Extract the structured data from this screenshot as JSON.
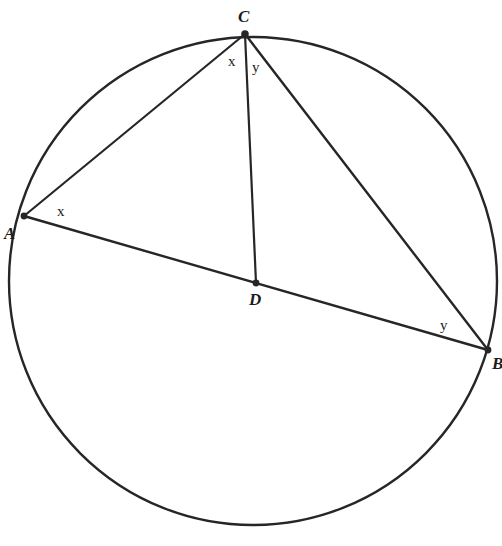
{
  "figure": {
    "canvas": {
      "width": 502,
      "height": 546
    },
    "colors": {
      "background": "#ffffff",
      "stroke": "#262626",
      "label": "#1c1c1c"
    },
    "circle": {
      "name": "circle-outline",
      "cx": 253,
      "cy": 281,
      "r": 244,
      "stroke_width": 2.4
    },
    "points": [
      {
        "id": "A",
        "label": "A",
        "x": 24,
        "y": 216,
        "label_x": 4,
        "label_y": 225,
        "dot_r": 3.4
      },
      {
        "id": "B",
        "label": "B",
        "x": 488,
        "y": 350,
        "label_x": 492,
        "label_y": 355,
        "dot_r": 3.4
      },
      {
        "id": "C",
        "label": "C",
        "x": 245,
        "y": 34,
        "label_x": 238,
        "label_y": 8,
        "dot_r": 3.8
      },
      {
        "id": "D",
        "label": "D",
        "x": 256,
        "y": 283,
        "label_x": 249,
        "label_y": 291,
        "dot_r": 3.4
      }
    ],
    "segments": [
      {
        "id": "CA",
        "name": "segment-c-a",
        "from": "C",
        "to": "A",
        "stroke_width": 2.2
      },
      {
        "id": "CD",
        "name": "segment-c-d",
        "from": "C",
        "to": "D",
        "stroke_width": 2.2
      },
      {
        "id": "CB",
        "name": "segment-c-b",
        "from": "C",
        "to": "B",
        "stroke_width": 2.4
      },
      {
        "id": "AB",
        "name": "segment-a-b-diameter",
        "from": "A",
        "to": "B",
        "stroke_width": 2.4
      }
    ],
    "angle_labels": [
      {
        "id": "x-at-C",
        "text": "x",
        "x": 228,
        "y": 54
      },
      {
        "id": "y-at-C",
        "text": "y",
        "x": 252,
        "y": 60
      },
      {
        "id": "x-at-A",
        "text": "x",
        "x": 57,
        "y": 204
      },
      {
        "id": "y-at-B",
        "text": "y",
        "x": 440,
        "y": 318
      }
    ]
  }
}
